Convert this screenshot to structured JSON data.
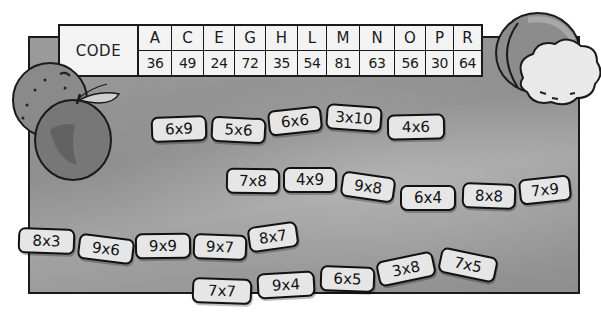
{
  "code_table": {
    "label": "CODE",
    "columns": [
      {
        "letter": "A",
        "value": "36"
      },
      {
        "letter": "C",
        "value": "49"
      },
      {
        "letter": "E",
        "value": "24"
      },
      {
        "letter": "G",
        "value": "72"
      },
      {
        "letter": "H",
        "value": "35"
      },
      {
        "letter": "L",
        "value": "54"
      },
      {
        "letter": "M",
        "value": "81"
      },
      {
        "letter": "N",
        "value": "63"
      },
      {
        "letter": "O",
        "value": "56"
      },
      {
        "letter": "P",
        "value": "30"
      },
      {
        "letter": "R",
        "value": "64"
      }
    ]
  },
  "tile_rows": [
    {
      "tiles": [
        "6x9",
        "5x6",
        "6x6",
        "3x10",
        "4x6"
      ]
    },
    {
      "tiles": [
        "7x8",
        "4x9",
        "9x8",
        "6x4",
        "8x8",
        "7x9"
      ]
    },
    {
      "tiles": [
        "8x3",
        "9x6",
        "9x9",
        "9x7",
        "8x7"
      ]
    },
    {
      "tiles": [
        "7x7",
        "9x4",
        "6x5",
        "3x8",
        "7x5"
      ]
    }
  ],
  "fruit": {
    "left": [
      "orange",
      "apple"
    ],
    "right": [
      "peach",
      "cauliflower"
    ]
  },
  "colors": {
    "board": "#959595",
    "tile": "#e6e6e6",
    "outline": "#111111"
  }
}
